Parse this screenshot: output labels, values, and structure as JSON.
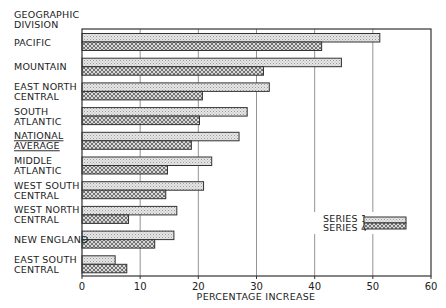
{
  "chart_data": {
    "type": "bar",
    "orientation": "horizontal",
    "title": "",
    "ylabel": "GEOGRAPHIC DIVISION",
    "xlabel": "PERCENTAGE INCREASE",
    "xlim": [
      0,
      60
    ],
    "xticks": [
      0,
      10,
      20,
      30,
      40,
      50,
      60
    ],
    "grid": true,
    "legend_position": "lower right",
    "categories": [
      [
        "PACIFIC"
      ],
      [
        "MOUNTAIN"
      ],
      [
        "EAST NORTH",
        "CENTRAL"
      ],
      [
        "SOUTH",
        "ATLANTIC"
      ],
      [
        "NATIONAL",
        "AVERAGE"
      ],
      [
        "MIDDLE",
        "ATLANTIC"
      ],
      [
        "WEST SOUTH",
        "CENTRAL"
      ],
      [
        "WEST NORTH",
        "CENTRAL"
      ],
      [
        "NEW ENGLAND"
      ],
      [
        "EAST SOUTH",
        "CENTRAL"
      ]
    ],
    "underlined_category_index": 4,
    "series": [
      {
        "name": "SERIES 1",
        "pattern": "dots-light",
        "values": [
          51.2,
          44.6,
          32.2,
          28.4,
          27.0,
          22.3,
          20.9,
          16.3,
          15.8,
          5.7
        ]
      },
      {
        "name": "SERIES 4",
        "pattern": "crosshatch-dark",
        "values": [
          41.2,
          31.2,
          20.7,
          20.2,
          18.8,
          14.7,
          14.4,
          8.0,
          12.5,
          7.7
        ]
      }
    ]
  },
  "header": {
    "line1": "GEOGRAPHIC",
    "line2": "DIVISION"
  },
  "legend": {
    "items": [
      "SERIES 1",
      "SERIES 4"
    ]
  }
}
